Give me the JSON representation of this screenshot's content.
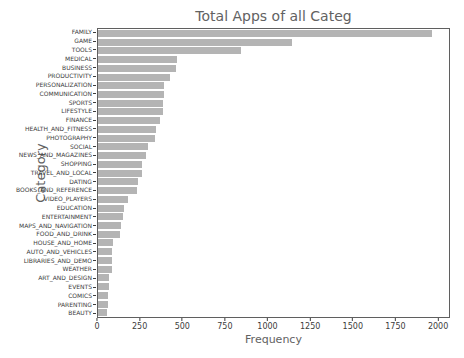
{
  "title": "Total Apps of all Categ",
  "chart_data": {
    "type": "bar",
    "orientation": "horizontal",
    "title": "Total Apps of all Categ",
    "xlabel": "Frequency",
    "ylabel": "Category",
    "xlim": [
      0,
      2070
    ],
    "x_ticks": [
      0,
      250,
      500,
      750,
      1000,
      1250,
      1500,
      1750,
      2000
    ],
    "grid": false,
    "legend": false,
    "bar_color": "#b4b4b4",
    "categories": [
      "FAMILY",
      "GAME",
      "TOOLS",
      "MEDICAL",
      "BUSINESS",
      "PRODUCTIVITY",
      "PERSONALIZATION",
      "COMMUNICATION",
      "SPORTS",
      "LIFESTYLE",
      "FINANCE",
      "HEALTH_AND_FITNESS",
      "PHOTOGRAPHY",
      "SOCIAL",
      "NEWS_AND_MAGAZINES",
      "SHOPPING",
      "TRAVEL_AND_LOCAL",
      "DATING",
      "BOOKS_AND_REFERENCE",
      "VIDEO_PLAYERS",
      "EDUCATION",
      "ENTERTAINMENT",
      "MAPS_AND_NAVIGATION",
      "FOOD_AND_DRINK",
      "HOUSE_AND_HOME",
      "AUTO_AND_VEHICLES",
      "LIBRARIES_AND_DEMO",
      "WEATHER",
      "ART_AND_DESIGN",
      "EVENTS",
      "COMICS",
      "PARENTING",
      "BEAUTY"
    ],
    "values": [
      1972,
      1144,
      843,
      463,
      460,
      424,
      392,
      387,
      384,
      382,
      366,
      341,
      335,
      295,
      283,
      260,
      258,
      234,
      231,
      175,
      156,
      149,
      137,
      127,
      88,
      85,
      84,
      82,
      65,
      64,
      60,
      60,
      53
    ]
  }
}
